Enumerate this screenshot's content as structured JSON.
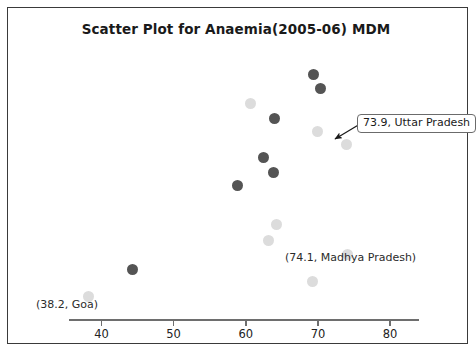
{
  "chart_data": {
    "type": "scatter",
    "title": "Scatter Plot for Anaemia(2005-06) MDM",
    "xlabel": "",
    "ylabel": "",
    "xlim": [
      35.5,
      84.0
    ],
    "grid": false,
    "legend": "none",
    "xticks": [
      40,
      50,
      60,
      70,
      80
    ],
    "xtick_labels": [
      "40",
      "50",
      "60",
      "70",
      "80"
    ],
    "series": [
      {
        "name": "dark-markers",
        "color": "#545454",
        "points": [
          {
            "x": 69.4,
            "y": 91.9
          },
          {
            "x": 70.4,
            "y": 86.5
          },
          {
            "x": 64.0,
            "y": 75.4
          },
          {
            "x": 62.4,
            "y": 60.9
          },
          {
            "x": 63.9,
            "y": 55.2
          },
          {
            "x": 58.8,
            "y": 50.2
          },
          {
            "x": 44.3,
            "y": 18.7
          }
        ]
      },
      {
        "name": "light-markers",
        "color": "#dcdcdc",
        "points": [
          {
            "x": 60.7,
            "y": 81.2
          },
          {
            "x": 69.9,
            "y": 70.5
          },
          {
            "x": 73.9,
            "y": 65.6
          },
          {
            "x": 64.3,
            "y": 35.4
          },
          {
            "x": 63.2,
            "y": 29.4
          },
          {
            "x": 74.1,
            "y": 24.1
          },
          {
            "x": 69.2,
            "y": 14.1
          },
          {
            "x": 38.2,
            "y": 8.4
          }
        ]
      }
    ],
    "annotations": [
      {
        "name": "uttar-pradesh",
        "text": "73.9, Uttar Pradesh",
        "style": "callout-box",
        "target_x": 73.9
      },
      {
        "name": "madhya-pradesh",
        "text": "(74.1, Madhya Pradesh)",
        "style": "plain",
        "target_x": 74.1
      },
      {
        "name": "goa",
        "text": "(38.2, Goa)",
        "style": "plain",
        "target_x": 38.2
      }
    ]
  },
  "colors": {
    "dark_marker": "#545454",
    "light_marker": "#dcdcdc",
    "axis": "#6e6e6e",
    "frame": "#3a3a3a",
    "text": "#1a1a1a",
    "background": "#ffffff"
  }
}
